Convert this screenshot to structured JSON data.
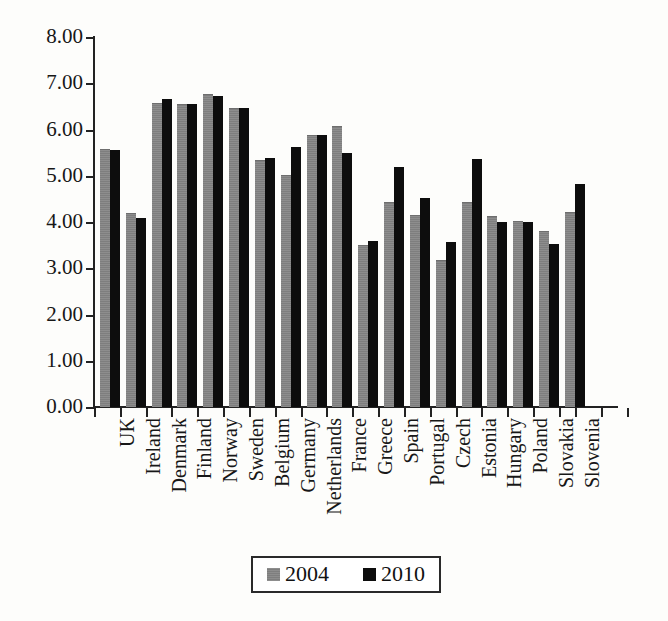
{
  "chart_data": {
    "type": "bar",
    "title": "",
    "xlabel": "",
    "ylabel": "",
    "ylim": [
      0,
      8
    ],
    "ytick_step": 1,
    "ytick_labels": [
      "0.00",
      "1.00",
      "2.00",
      "3.00",
      "4.00",
      "5.00",
      "6.00",
      "7.00",
      "8.00"
    ],
    "grid": false,
    "legend_position": "bottom-center",
    "categories": [
      "UK",
      "Ireland",
      "Denmark",
      "Finland",
      "Norway",
      "Sweden",
      "Belgium",
      "Germany",
      "Netherlands",
      "France",
      "Greece",
      "Spain",
      "Portugal",
      "Czech",
      "Estonia",
      "Hungary",
      "Poland",
      "Slovakia",
      "Slovenia"
    ],
    "series": [
      {
        "name": "2004",
        "color": "#808080",
        "values": [
          5.56,
          4.17,
          6.55,
          6.53,
          6.75,
          6.45,
          5.32,
          5.0,
          5.86,
          6.05,
          3.48,
          4.42,
          4.13,
          3.16,
          4.42,
          4.1,
          4.0,
          3.78,
          4.2
        ]
      },
      {
        "name": "2010",
        "color": "#000000",
        "values": [
          5.56,
          4.08,
          6.67,
          6.55,
          6.72,
          6.47,
          5.38,
          5.63,
          5.88,
          5.5,
          3.58,
          5.18,
          4.52,
          3.57,
          5.37,
          4.0,
          4.0,
          3.53,
          4.82
        ]
      }
    ]
  },
  "legend": {
    "entries": [
      {
        "label": "2004"
      },
      {
        "label": "2010"
      }
    ]
  }
}
